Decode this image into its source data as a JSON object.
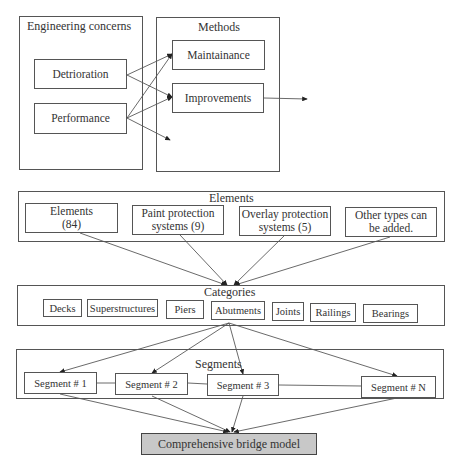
{
  "top": {
    "concerns": {
      "title": "Engineering concerns",
      "items": [
        "Detrioration",
        "Performance"
      ]
    },
    "methods": {
      "title": "Methods",
      "items": [
        "Maintainance",
        "Improvements"
      ]
    }
  },
  "elements": {
    "title": "Elements",
    "items": [
      {
        "line1": "Elements",
        "line2": "(84)"
      },
      {
        "line1": "Paint protection",
        "line2": "systems (9)"
      },
      {
        "line1": "Overlay protection",
        "line2": "systems (5)"
      },
      {
        "line1": "Other types can",
        "line2": "be added."
      }
    ]
  },
  "categories": {
    "title": "Categories",
    "items": [
      "Decks",
      "Superstructures",
      "Piers",
      "Abutments",
      "Joints",
      "Railings",
      "Bearings"
    ]
  },
  "segments": {
    "title": "Segments",
    "items": [
      "Segment # 1",
      "Segment # 2",
      "Segment # 3",
      "Segment # N"
    ]
  },
  "model": {
    "label": "Comprehensive bridge model",
    "fill": "#c8c8c8"
  }
}
